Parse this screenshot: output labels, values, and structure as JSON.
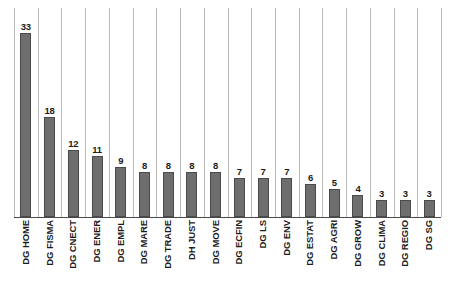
{
  "chart_data": {
    "type": "bar",
    "title": "",
    "subtitle": "",
    "xlabel": "",
    "ylabel": "",
    "ylim": [
      0,
      35
    ],
    "grid": "vertical-category-separators",
    "legend": "none",
    "orientation": "vertical",
    "value_labels": true,
    "tick_label_rotation": -90,
    "categories": [
      "DG HOME",
      "DG FISMA",
      "DG CNECT",
      "DG ENER",
      "DG EMPL",
      "DG MARE",
      "DG TRADE",
      "DH JUST",
      "DG MOVE",
      "DG ECFIN",
      "DG LS",
      "DG ENV",
      "DG ESTAT",
      "DG AGRI",
      "DG GROW",
      "DG CLIMA",
      "DG REGIO",
      "DG SG"
    ],
    "values": [
      33,
      18,
      12,
      11,
      9,
      8,
      8,
      8,
      8,
      7,
      7,
      7,
      6,
      5,
      4,
      3,
      3,
      3
    ],
    "bars": [
      {
        "category": "DG HOME",
        "value": 33
      },
      {
        "category": "DG FISMA",
        "value": 18
      },
      {
        "category": "DG CNECT",
        "value": 12
      },
      {
        "category": "DG ENER",
        "value": 11
      },
      {
        "category": "DG EMPL",
        "value": 9
      },
      {
        "category": "DG MARE",
        "value": 8
      },
      {
        "category": "DG TRADE",
        "value": 8
      },
      {
        "category": "DH JUST",
        "value": 8
      },
      {
        "category": "DG MOVE",
        "value": 8
      },
      {
        "category": "DG ECFIN",
        "value": 7
      },
      {
        "category": "DG LS",
        "value": 7
      },
      {
        "category": "DG ENV",
        "value": 7
      },
      {
        "category": "DG ESTAT",
        "value": 6
      },
      {
        "category": "DG AGRI",
        "value": 5
      },
      {
        "category": "DG GROW",
        "value": 4
      },
      {
        "category": "DG CLIMA",
        "value": 3
      },
      {
        "category": "DG REGIO",
        "value": 3
      },
      {
        "category": "DG SG",
        "value": 3
      }
    ],
    "colors": {
      "bar_fill": "#6e6e6e",
      "bar_border": "#4a4a4a",
      "gridline": "#b9b9b9",
      "axis_line": "#4a4a4a",
      "text": "#1c1c1c",
      "background": "#ffffff"
    }
  }
}
